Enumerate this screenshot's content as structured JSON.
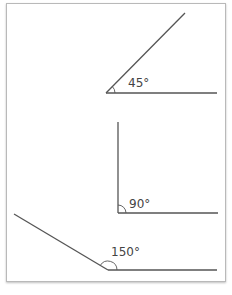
{
  "diagram": {
    "colors": {
      "line": "#555555",
      "text": "#444444",
      "border": "#b9b9b9"
    },
    "angles": [
      {
        "label": "45°",
        "degrees": 45
      },
      {
        "label": "90°",
        "degrees": 90
      },
      {
        "label": "150°",
        "degrees": 150
      }
    ]
  }
}
